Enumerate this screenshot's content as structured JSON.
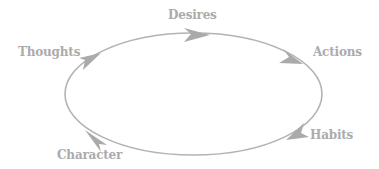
{
  "diagram": {
    "type": "cycle",
    "colors": {
      "stroke": "#b3b3b3",
      "arrow": "#aaaaaa",
      "text": "#ababab",
      "background": "#ffffff"
    },
    "nodes": [
      {
        "id": "desires",
        "label": "Desires"
      },
      {
        "id": "actions",
        "label": "Actions"
      },
      {
        "id": "habits",
        "label": "Habits"
      },
      {
        "id": "character",
        "label": "Character"
      },
      {
        "id": "thoughts",
        "label": "Thoughts"
      }
    ],
    "flow_direction": "clockwise",
    "edges": [
      {
        "from": "thoughts",
        "to": "desires"
      },
      {
        "from": "desires",
        "to": "actions"
      },
      {
        "from": "actions",
        "to": "habits"
      },
      {
        "from": "habits",
        "to": "character"
      },
      {
        "from": "character",
        "to": "thoughts"
      }
    ]
  }
}
